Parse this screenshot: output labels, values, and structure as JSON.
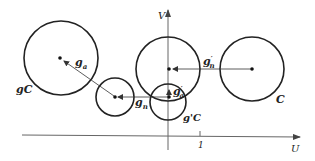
{
  "axes": {
    "x_label": "U",
    "y_label": "V",
    "tick_label": "1"
  },
  "circles": {
    "gC": {
      "label": "gC"
    },
    "C": {
      "label": "C"
    },
    "gprimeC": {
      "label": "g'C"
    },
    "middle": {
      "label": ""
    },
    "small_left": {
      "label": ""
    }
  },
  "vectors": {
    "g_a": {
      "base": "g",
      "sub": "a",
      "prime": ""
    },
    "g_n": {
      "base": "g",
      "sub": "n",
      "prime": ""
    },
    "gp_n": {
      "base": "g",
      "sub": "n",
      "prime": "′"
    },
    "gp_a": {
      "base": "g",
      "sub": "a",
      "prime": "′"
    }
  },
  "colors": {
    "stroke": "#222222",
    "axis": "#555555",
    "background": "#ffffff"
  }
}
